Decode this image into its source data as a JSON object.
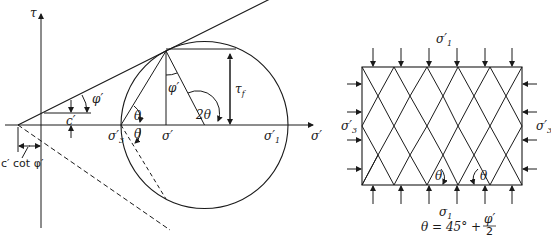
{
  "mohr_diagram": {
    "axis_labels": {
      "tau": "τ",
      "sigma": "σ′"
    },
    "labels": {
      "c_prime": "c′",
      "phi_prime_envelope": "φ′",
      "phi_prime_center": "φ′",
      "c_cot_phi": "c′ cot φ′",
      "sigma3": "σ′",
      "sigma3_sub": "3",
      "sigma_center": "σ′",
      "sigma1": "σ′",
      "sigma1_sub": "1",
      "tau_f": "τ",
      "tau_f_sub": "f",
      "two_theta": "2θ",
      "theta_upper": "θ",
      "theta_lower": "θ"
    }
  },
  "element_diagram": {
    "labels": {
      "top_stress": "σ′",
      "top_stress_sub": "1",
      "left_stress": "σ′",
      "left_stress_sub": "3",
      "right_stress": "σ′",
      "right_stress_sub": "3",
      "bottom_stress": "σ",
      "bottom_stress_sub": "1",
      "theta_left": "θ",
      "theta_right": "θ"
    },
    "formula": {
      "lhs": "θ = 45° +",
      "numerator": "φ′",
      "denominator": "2"
    }
  }
}
